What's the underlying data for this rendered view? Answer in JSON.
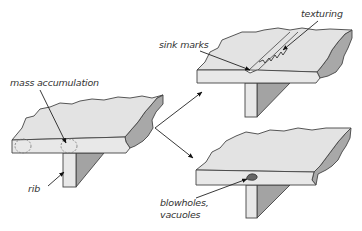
{
  "diagram": {
    "title": "",
    "panels": [
      {
        "id": "original",
        "description": "Plate with rib (T-section)",
        "labels": [
          {
            "text": "mass accumulation",
            "x": 10,
            "y": 86
          },
          {
            "text": "rib",
            "x": 28,
            "y": 192
          }
        ]
      },
      {
        "id": "defect-sink-marks",
        "description": "Plate with rib showing sink marks and texturing",
        "labels": [
          {
            "text": "sink marks",
            "x": 159,
            "y": 48
          },
          {
            "text": "texturing",
            "x": 301,
            "y": 17
          }
        ]
      },
      {
        "id": "defect-blowholes",
        "description": "Plate with rib showing blowholes / vacuoles",
        "labels": [
          {
            "text": "blowholes,",
            "x": 160,
            "y": 206
          },
          {
            "text": "vacuoles",
            "x": 160,
            "y": 218
          }
        ]
      }
    ],
    "colors": {
      "surface": "#e3e3e3",
      "shade": "#a8a8a8",
      "outline": "#444444",
      "text": "#333333"
    }
  }
}
